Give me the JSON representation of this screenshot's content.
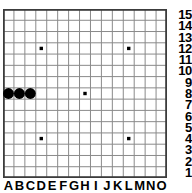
{
  "board": {
    "type": "gomoku-renju-board",
    "size": 15,
    "cell_px": 10.9,
    "grid_color": "#8a8a8a",
    "border_color": "#3c3c3c",
    "background_color": "#ffffff",
    "star_point_color": "#000000",
    "files": [
      "A",
      "B",
      "C",
      "D",
      "E",
      "F",
      "G",
      "H",
      "I",
      "J",
      "K",
      "L",
      "M",
      "N",
      "O"
    ],
    "ranks": [
      "15",
      "14",
      "13",
      "12",
      "11",
      "10",
      "9",
      "8",
      "7",
      "6",
      "5",
      "4",
      "3",
      "2",
      "1"
    ],
    "star_points": [
      {
        "file": "D",
        "rank": "12"
      },
      {
        "file": "L",
        "rank": "12"
      },
      {
        "file": "H",
        "rank": "8"
      },
      {
        "file": "D",
        "rank": "4"
      },
      {
        "file": "L",
        "rank": "4"
      }
    ],
    "stones": [
      {
        "file": "A",
        "rank": "8",
        "color": "black",
        "color_hex": "#000000"
      },
      {
        "file": "B",
        "rank": "8",
        "color": "black",
        "color_hex": "#000000"
      },
      {
        "file": "C",
        "rank": "8",
        "color": "black",
        "color_hex": "#000000"
      }
    ]
  }
}
